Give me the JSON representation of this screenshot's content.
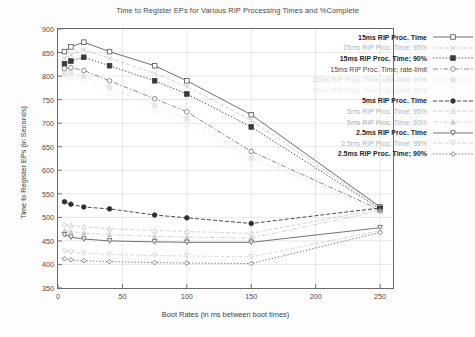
{
  "chart_data": {
    "type": "line",
    "title": "Time to Register EPs for Various RIP Processing Times and %Complete",
    "xlabel": "Boot Rates (in ms between boot times)",
    "ylabel": "Time to Register EPs (in Seconds)",
    "xlim": [
      0,
      260
    ],
    "ylim": [
      350,
      900
    ],
    "xticks": [
      0,
      50,
      100,
      150,
      200,
      250
    ],
    "yticks": [
      350,
      400,
      450,
      500,
      550,
      600,
      650,
      700,
      750,
      800,
      850,
      900
    ],
    "grid": true,
    "legend_position": "top-right",
    "x": [
      5,
      10,
      20,
      40,
      75,
      100,
      150,
      250
    ],
    "series": [
      {
        "name": "15ms RIP Proc. Time",
        "marker": "square-open",
        "dash": "solid",
        "color": "#555555",
        "faded": 0,
        "values": [
          852,
          862,
          872,
          852,
          822,
          790,
          718,
          522
        ]
      },
      {
        "name": "15ms RIP Proc. Time; 95%",
        "marker": "x",
        "dash": "dash",
        "color": "#8d8d8d",
        "faded": 1,
        "values": [
          838,
          845,
          856,
          838,
          806,
          778,
          706,
          520
        ]
      },
      {
        "name": "15ms RIP Proc. Time; 90%",
        "marker": "square-filled",
        "dash": "dot",
        "color": "#3b3b3b",
        "faded": 0,
        "values": [
          826,
          832,
          840,
          822,
          790,
          762,
          692,
          518
        ]
      },
      {
        "name": "15ms RIP Proc. Time; rate-limit",
        "marker": "circle-open",
        "dash": "dashdot",
        "color": "#777777",
        "faded": 0,
        "values": [
          816,
          818,
          812,
          790,
          752,
          724,
          640,
          516
        ]
      },
      {
        "name": "15ms RIP Proc. Time; rate-limit; 90%",
        "marker": "square-filled",
        "dash": "dash",
        "color": "#9a9a9a",
        "faded": 2,
        "values": [
          806,
          808,
          800,
          776,
          738,
          710,
          626,
          514
        ]
      },
      {
        "name": "15ms RIP Proc. Time; rate-limit; 85%",
        "marker": "square-open",
        "dash": "dot",
        "color": "#a8a8a8",
        "faded": 3,
        "values": [
          796,
          798,
          790,
          764,
          726,
          698,
          614,
          512
        ]
      },
      {
        "name": "5ms RIP Proc. Time",
        "marker": "circle-filled",
        "dash": "dash",
        "color": "#2e2e2e",
        "faded": 0,
        "values": [
          533,
          528,
          522,
          518,
          505,
          499,
          487,
          520
        ]
      },
      {
        "name": "5ms RIP Proc. Time; 95%",
        "marker": "triangle-open",
        "dash": "dash",
        "color": "#8d8d8d",
        "faded": 1,
        "values": [
          486,
          483,
          480,
          476,
          472,
          470,
          466,
          518
        ]
      },
      {
        "name": "5ms RIP Proc. Time; 90%",
        "marker": "triangle-filled",
        "dash": "dashdot",
        "color": "#8a8a8a",
        "faded": 1,
        "values": [
          472,
          470,
          467,
          463,
          460,
          458,
          456,
          514
        ]
      },
      {
        "name": "2.5ms RIP Proc. Time",
        "marker": "triangle-down",
        "dash": "solid",
        "color": "#5a5a5a",
        "faded": 0,
        "values": [
          463,
          458,
          454,
          450,
          448,
          447,
          447,
          478
        ]
      },
      {
        "name": "2.5ms RIP Proc. Time; 95%",
        "marker": "triangle-down",
        "dash": "dash",
        "color": "#9a9a9a",
        "faded": 1,
        "values": [
          428,
          426,
          424,
          421,
          419,
          418,
          416,
          472
        ]
      },
      {
        "name": "2.5ms RIP Proc. Time; 90%",
        "marker": "diamond-open",
        "dash": "dot",
        "color": "#6a6a6a",
        "faded": 0,
        "values": [
          412,
          410,
          408,
          406,
          404,
          403,
          402,
          468
        ]
      }
    ]
  }
}
